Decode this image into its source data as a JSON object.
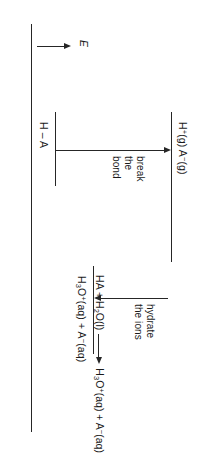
{
  "figure": {
    "type": "energy-level-diagram",
    "axis": {
      "symbol": "E",
      "direction": "up",
      "meaning": "energy increases upward"
    },
    "levels": [
      {
        "id": "reactant",
        "label_html": "H – A",
        "label_plain": "H – A",
        "relative_energy": "lowest"
      },
      {
        "id": "intermediate",
        "label_html": "H<sup>+</sup>(g) A<sup>−</sup>(g)",
        "label_plain": "H+(g) A-(g)",
        "relative_energy": "highest"
      },
      {
        "id": "product",
        "label_html": "H<sub>3</sub>O<sup>+</sup>(aq) + A<sup>−</sup>(aq)",
        "label_plain": "H3O+(aq) + A-(aq)",
        "relative_energy": "middle"
      }
    ],
    "steps": [
      {
        "id": "break-bond",
        "label": "break\nthe\nbond",
        "direction": "up",
        "from": "reactant",
        "to": "intermediate"
      },
      {
        "id": "hydrate-ions",
        "label": "hydrate\nthe ions",
        "direction": "down",
        "from": "intermediate",
        "to": "product"
      }
    ]
  },
  "caption": {
    "reactants_html": "HA + H<sub>2</sub>O(l)",
    "reactants_plain": "HA + H2O(l)",
    "arrow": "⟶",
    "products_html": "H<sub>3</sub>O<sup>+</sup>(aq) + A<sup>−</sup>(aq)",
    "products_plain": "H3O+(aq) + A-(aq)"
  },
  "chart_data": {
    "type": "line",
    "title": "",
    "xlabel": "",
    "ylabel": "E",
    "categories": [
      "H – A",
      "H+(g) A-(g)",
      "H3O+(aq) + A-(aq)"
    ],
    "values": [
      0,
      100,
      42
    ],
    "annotations": [
      "break the bond",
      "hydrate the ions"
    ],
    "grid": false,
    "legend": "none"
  },
  "colors": {
    "ink": "#1a1a1a",
    "line": "#262626",
    "background": "#ffffff"
  }
}
